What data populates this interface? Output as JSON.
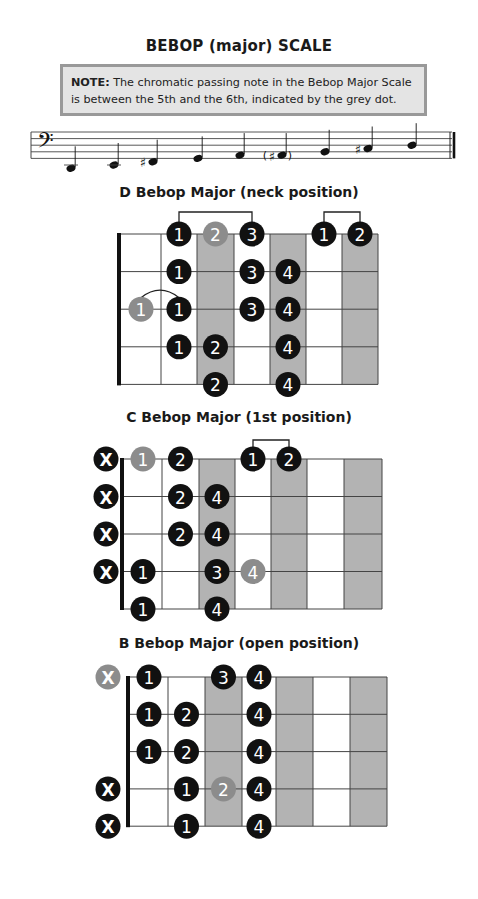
{
  "title": "BEBOP (major) SCALE",
  "note": {
    "label": "NOTE:",
    "text": " The chromatic passing note in the Bebop Major Scale is between the 5th and the 6th, indicated by the grey dot."
  },
  "staff": {
    "clef": "bass",
    "notes": [
      {
        "pitch": "D2",
        "accidental": "",
        "parenthesized": false
      },
      {
        "pitch": "E2",
        "accidental": "",
        "parenthesized": false
      },
      {
        "pitch": "F#2",
        "accidental": "sharp",
        "parenthesized": false
      },
      {
        "pitch": "G2",
        "accidental": "",
        "parenthesized": false
      },
      {
        "pitch": "A2",
        "accidental": "",
        "parenthesized": false
      },
      {
        "pitch": "A#2",
        "accidental": "sharp",
        "parenthesized": true
      },
      {
        "pitch": "B2",
        "accidental": "",
        "parenthesized": false
      },
      {
        "pitch": "C#3",
        "accidental": "sharp",
        "parenthesized": false
      },
      {
        "pitch": "D3",
        "accidental": "",
        "parenthesized": false
      }
    ]
  },
  "colors": {
    "dot_black": "#111111",
    "dot_grey": "#8c8c8c",
    "shade": "#b3b3b3",
    "line": "#333333"
  },
  "diagrams": [
    {
      "title": "D Bebop Major (neck position)",
      "strings": 5,
      "frets": 7,
      "shaded_frets": [
        3,
        5,
        7
      ],
      "open_markers": [],
      "dots": [
        {
          "string": 1,
          "fret": 2,
          "finger": "1",
          "grey": false
        },
        {
          "string": 1,
          "fret": 3,
          "finger": "2",
          "grey": true
        },
        {
          "string": 1,
          "fret": 4,
          "finger": "3",
          "grey": false
        },
        {
          "string": 1,
          "fret": 6,
          "finger": "1",
          "grey": false
        },
        {
          "string": 1,
          "fret": 7,
          "finger": "2",
          "grey": false
        },
        {
          "string": 2,
          "fret": 2,
          "finger": "1",
          "grey": false
        },
        {
          "string": 2,
          "fret": 4,
          "finger": "3",
          "grey": false
        },
        {
          "string": 2,
          "fret": 5,
          "finger": "4",
          "grey": false
        },
        {
          "string": 3,
          "fret": 1,
          "finger": "1",
          "grey": true
        },
        {
          "string": 3,
          "fret": 2,
          "finger": "1",
          "grey": false
        },
        {
          "string": 3,
          "fret": 4,
          "finger": "3",
          "grey": false
        },
        {
          "string": 3,
          "fret": 5,
          "finger": "4",
          "grey": false
        },
        {
          "string": 4,
          "fret": 2,
          "finger": "1",
          "grey": false
        },
        {
          "string": 4,
          "fret": 3,
          "finger": "2",
          "grey": false
        },
        {
          "string": 4,
          "fret": 5,
          "finger": "4",
          "grey": false
        },
        {
          "string": 5,
          "fret": 3,
          "finger": "2",
          "grey": false
        },
        {
          "string": 5,
          "fret": 5,
          "finger": "4",
          "grey": false
        }
      ],
      "brackets": [
        {
          "string": 1,
          "from_fret": 2,
          "to_fret": 4
        },
        {
          "string": 1,
          "from_fret": 6,
          "to_fret": 7
        }
      ],
      "slides": [
        {
          "string": 3,
          "from_fret": 1,
          "to_fret": 2
        }
      ]
    },
    {
      "title": "C Bebop Major (1st position)",
      "strings": 5,
      "frets": 7,
      "shaded_frets": [
        3,
        5,
        7
      ],
      "open_markers": [
        {
          "string": 1,
          "label": "X",
          "grey": false
        },
        {
          "string": 2,
          "label": "X",
          "grey": false
        },
        {
          "string": 3,
          "label": "X",
          "grey": false
        },
        {
          "string": 4,
          "label": "X",
          "grey": false
        }
      ],
      "dots": [
        {
          "string": 1,
          "fret": 1,
          "finger": "1",
          "grey": true
        },
        {
          "string": 1,
          "fret": 2,
          "finger": "2",
          "grey": false
        },
        {
          "string": 1,
          "fret": 4,
          "finger": "1",
          "grey": false
        },
        {
          "string": 1,
          "fret": 5,
          "finger": "2",
          "grey": false
        },
        {
          "string": 2,
          "fret": 2,
          "finger": "2",
          "grey": false
        },
        {
          "string": 2,
          "fret": 3,
          "finger": "4",
          "grey": false
        },
        {
          "string": 3,
          "fret": 2,
          "finger": "2",
          "grey": false
        },
        {
          "string": 3,
          "fret": 3,
          "finger": "4",
          "grey": false
        },
        {
          "string": 4,
          "fret": 1,
          "finger": "1",
          "grey": false
        },
        {
          "string": 4,
          "fret": 3,
          "finger": "3",
          "grey": false
        },
        {
          "string": 4,
          "fret": 4,
          "finger": "4",
          "grey": true
        },
        {
          "string": 5,
          "fret": 1,
          "finger": "1",
          "grey": false
        },
        {
          "string": 5,
          "fret": 3,
          "finger": "4",
          "grey": false
        }
      ],
      "brackets": [
        {
          "string": 1,
          "from_fret": 4,
          "to_fret": 5
        }
      ],
      "slides": []
    },
    {
      "title": "B Bebop Major (open position)",
      "strings": 5,
      "frets": 7,
      "shaded_frets": [
        3,
        5,
        7
      ],
      "open_markers": [
        {
          "string": 1,
          "label": "X",
          "grey": true
        },
        {
          "string": 4,
          "label": "X",
          "grey": false
        },
        {
          "string": 5,
          "label": "X",
          "grey": false
        }
      ],
      "dots": [
        {
          "string": 1,
          "fret": 1,
          "finger": "1",
          "grey": false
        },
        {
          "string": 1,
          "fret": 3,
          "finger": "3",
          "grey": false
        },
        {
          "string": 1,
          "fret": 4,
          "finger": "4",
          "grey": false
        },
        {
          "string": 2,
          "fret": 1,
          "finger": "1",
          "grey": false
        },
        {
          "string": 2,
          "fret": 2,
          "finger": "2",
          "grey": false
        },
        {
          "string": 2,
          "fret": 4,
          "finger": "4",
          "grey": false
        },
        {
          "string": 3,
          "fret": 1,
          "finger": "1",
          "grey": false
        },
        {
          "string": 3,
          "fret": 2,
          "finger": "2",
          "grey": false
        },
        {
          "string": 3,
          "fret": 4,
          "finger": "4",
          "grey": false
        },
        {
          "string": 4,
          "fret": 2,
          "finger": "1",
          "grey": false
        },
        {
          "string": 4,
          "fret": 3,
          "finger": "2",
          "grey": true
        },
        {
          "string": 4,
          "fret": 4,
          "finger": "4",
          "grey": false
        },
        {
          "string": 5,
          "fret": 2,
          "finger": "1",
          "grey": false
        },
        {
          "string": 5,
          "fret": 4,
          "finger": "4",
          "grey": false
        }
      ],
      "brackets": [],
      "slides": []
    }
  ]
}
